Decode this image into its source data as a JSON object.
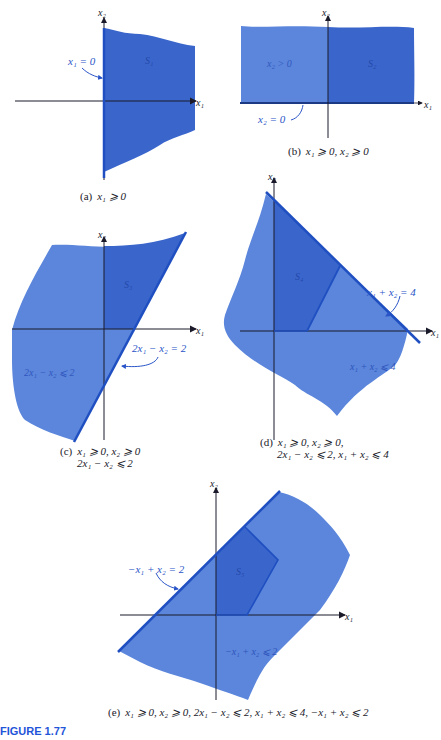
{
  "figure": {
    "title": "FIGURE 1.77",
    "colors": {
      "light_region": "#5b86dc",
      "dark_region": "#3a66cc",
      "line": "#1f4fc0",
      "axis": "#1a1a2a",
      "annotation": "#2a55c8",
      "figure_title": "#1f55d8"
    }
  },
  "panels": {
    "a": {
      "axis_x": "x₁",
      "axis_y": "x₂",
      "region_label": "S₁",
      "line_label": "x₁ = 0",
      "caption_tag": "(a)",
      "caption": "x₁ ⩾ 0"
    },
    "b": {
      "axis_x": "x₁",
      "axis_y": "x₂",
      "region_label": "S₂",
      "half_plane_label": "x₂ > 0",
      "line_label": "x₂ = 0",
      "caption_tag": "(b)",
      "caption": "x₁ ⩾ 0, x₂ ⩾ 0"
    },
    "c": {
      "axis_x": "x₁",
      "axis_y": "x₂",
      "region_label": "S₃",
      "line_label": "2x₁ − x₂ = 2",
      "half_plane_label": "2x₁ − x₂ ⩽ 2",
      "caption_tag": "(c)",
      "caption_line1": "x₁ ⩾ 0, x₂ ⩾ 0",
      "caption_line2": "2x₁ − x₂ ⩽ 2"
    },
    "d": {
      "axis_x": "x₁",
      "axis_y": "x₂",
      "region_label": "S₄",
      "line_label": "x₁ + x₂ = 4",
      "half_plane_label": "x₁ + x₂ ⩽ 4",
      "caption_tag": "(d)",
      "caption_line1": "x₁ ⩾ 0, x₂ ⩾ 0,",
      "caption_line2": "2x₁ − x₂ ⩽ 2, x₁ + x₂ ⩽ 4"
    },
    "e": {
      "axis_x": "x₁",
      "axis_y": "x₂",
      "region_label": "S₅",
      "line_label": "−x₁ + x₂ = 2",
      "half_plane_label": "−x₁ + x₂ ⩽ 2",
      "caption_tag": "(e)",
      "caption": "x₁ ⩾ 0, x₂ ⩾ 0, 2x₁ − x₂ ⩽ 2, x₁ + x₂ ⩽ 4, −x₁ + x₂ ⩽ 2"
    }
  }
}
